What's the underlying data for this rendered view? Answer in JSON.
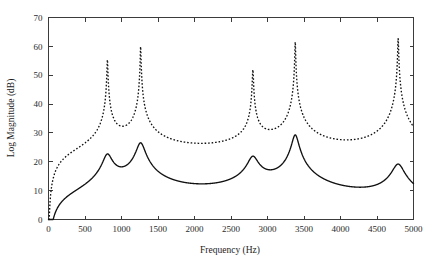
{
  "figure": {
    "background_color": "#ffffff",
    "foreground_color": "#111111"
  },
  "chart_data": {
    "type": "line",
    "title": "",
    "xlabel": "Frequency (Hz)",
    "ylabel": "Log Magnitude (dB)",
    "xlim": [
      0,
      5000
    ],
    "ylim": [
      0,
      70
    ],
    "xticks": [
      0,
      500,
      1000,
      1500,
      2000,
      2500,
      3000,
      3500,
      4000,
      4500,
      5000
    ],
    "xtick_labels": [
      "0",
      "500",
      "1000",
      "1500",
      "2000",
      "2500",
      "3000",
      "3500",
      "4000",
      "4500",
      "5000"
    ],
    "yticks": [
      0,
      10,
      20,
      30,
      40,
      50,
      60,
      70
    ],
    "ytick_labels": [
      "0",
      "10",
      "20",
      "30",
      "40",
      "50",
      "60",
      "70"
    ],
    "grid": false,
    "legend": null,
    "legend_position": "none",
    "series": [
      {
        "name": "solid-curve",
        "style": "solid",
        "color": "#111111",
        "peaks": [
          {
            "x": 807,
            "y": 22.0
          },
          {
            "x": 1262,
            "y": 26.5
          },
          {
            "x": 2800,
            "y": 19.5
          },
          {
            "x": 3380,
            "y": 29.0
          },
          {
            "x": 4790,
            "y": 17.5
          }
        ],
        "bandwidths": [
          115,
          110,
          130,
          85,
          150
        ],
        "valleys": [
          {
            "x": 1040,
            "y": 16.5
          },
          {
            "x": 2090,
            "y": 0.7
          },
          {
            "x": 3080,
            "y": 14.0
          },
          {
            "x": 4100,
            "y": 1.1
          }
        ],
        "endpoints": [
          {
            "x": 0,
            "y": 0.3
          },
          {
            "x": 5000,
            "y": 12.0
          }
        ]
      },
      {
        "name": "dotted-curve",
        "style": "dotted",
        "color": "#111111",
        "peaks": [
          {
            "x": 807,
            "y": 57.0
          },
          {
            "x": 1262,
            "y": 61.0
          },
          {
            "x": 2800,
            "y": 52.0
          },
          {
            "x": 3380,
            "y": 62.0
          },
          {
            "x": 4790,
            "y": 63.0
          }
        ],
        "bandwidths": [
          11,
          9,
          13,
          9,
          10
        ],
        "valleys": [
          {
            "x": 1040,
            "y": 16.5
          },
          {
            "x": 2090,
            "y": 0.7
          },
          {
            "x": 3080,
            "y": 14.0
          },
          {
            "x": 4100,
            "y": 1.1
          }
        ],
        "endpoints": [
          {
            "x": 0,
            "y": 0.3
          },
          {
            "x": 5000,
            "y": 13.0
          }
        ]
      }
    ]
  }
}
